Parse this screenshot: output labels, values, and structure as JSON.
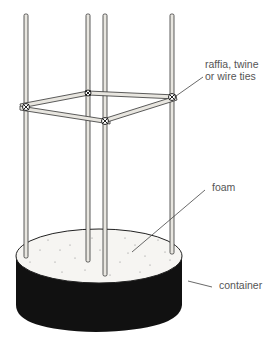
{
  "diagram": {
    "labels": {
      "ties": "raffia, twine\nor wire ties",
      "foam": "foam",
      "container": "container"
    },
    "components": [
      "stakes",
      "horizontal cross bars",
      "raffia, twine or wire ties",
      "foam",
      "container"
    ],
    "stake_count": 4,
    "colors": {
      "line": "#333333",
      "stake_fill": "#e8e6e0",
      "container": "#111111",
      "foam": "#f6f5f2",
      "label_text": "#555555"
    }
  }
}
